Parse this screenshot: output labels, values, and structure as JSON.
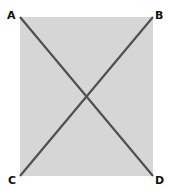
{
  "diagram": {
    "type": "rectangle-with-diagonals",
    "fill_color": "#d6d6d6",
    "line_color": "#505050",
    "vertices": [
      {
        "id": "A",
        "label": "A",
        "position": "top-left"
      },
      {
        "id": "B",
        "label": "B",
        "position": "top-right"
      },
      {
        "id": "C",
        "label": "C",
        "position": "bottom-left"
      },
      {
        "id": "D",
        "label": "D",
        "position": "bottom-right"
      }
    ],
    "diagonals": [
      {
        "from": "A",
        "to": "D"
      },
      {
        "from": "B",
        "to": "C"
      }
    ]
  }
}
